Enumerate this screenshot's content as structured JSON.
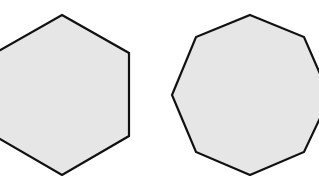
{
  "figure": {
    "background": "#ffffff",
    "fill": "#e6e6e6",
    "stroke": "#111111",
    "stroke_width": 2.2,
    "shapes": [
      {
        "name": "hexagon",
        "sides": 6,
        "points": "62,15 129,53 129,136 62,175 -5,136 -5,53"
      },
      {
        "name": "nonagon",
        "sides": 9,
        "points": "250,15 304,37 321,76 321,116 304,152 250,175 196,152 172,95 196,37"
      }
    ]
  }
}
